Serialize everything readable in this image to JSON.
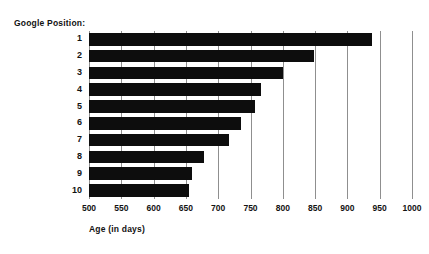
{
  "chart_data": {
    "type": "bar",
    "orientation": "horizontal",
    "title": "",
    "subtitle": "",
    "series_axis_title": "Google Position:",
    "xlabel": "Age (in days)",
    "ylabel": "Google Position:",
    "categories": [
      "1",
      "2",
      "3",
      "4",
      "5",
      "6",
      "7",
      "8",
      "9",
      "10"
    ],
    "values": [
      938,
      848,
      800,
      767,
      757,
      736,
      716,
      678,
      660,
      655
    ],
    "series": [
      {
        "name": "Age (in days)",
        "values": [
          938,
          848,
          800,
          767,
          757,
          736,
          716,
          678,
          660,
          655
        ]
      }
    ],
    "xlim": [
      500,
      1000
    ],
    "xticks": [
      500,
      550,
      600,
      650,
      700,
      750,
      800,
      850,
      900,
      950,
      1000
    ],
    "xtick_labels": [
      "500",
      "550",
      "600",
      "650",
      "700",
      "750",
      "800",
      "850",
      "900",
      "950",
      "1000"
    ],
    "grid": "vertical-only",
    "legend": "none",
    "bar_color": "#0d0d0d",
    "gridline_color": "#8f8f8f",
    "background_color": "#ffffff",
    "annotations": []
  }
}
